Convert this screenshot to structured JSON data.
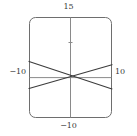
{
  "figure": {
    "name": "line-plot",
    "background": "#ffffff",
    "frame": {
      "color": "#6e6e6e",
      "corner_radius": 6,
      "left_px": 29,
      "right_px": 112,
      "top_px": 17,
      "bottom_px": 118
    },
    "axis_color": "#808080",
    "curve_color": "#3c3c3c"
  },
  "labels": {
    "ymax": "15",
    "ymin": "−10",
    "xmin": "−10",
    "xmax": "10"
  },
  "chart_data": {
    "type": "line",
    "title": "",
    "xlabel": "",
    "ylabel": "",
    "xlim": [
      -10,
      10
    ],
    "ylim": [
      -10,
      15
    ],
    "grid": false,
    "legend": null,
    "xticks": [
      -10,
      10
    ],
    "yticks": [
      -10,
      15
    ],
    "axes_origin": [
      0,
      0
    ],
    "series": [
      {
        "name": "line-descending",
        "x": [
          -10,
          10
        ],
        "values": [
          4.0,
          -2.8
        ],
        "color": "#3c3c3c"
      },
      {
        "name": "line-ascending",
        "x": [
          -10,
          10
        ],
        "values": [
          -2.7,
          3.2
        ],
        "color": "#3c3c3c"
      }
    ],
    "intersection": [
      0.4,
      0.6
    ]
  }
}
